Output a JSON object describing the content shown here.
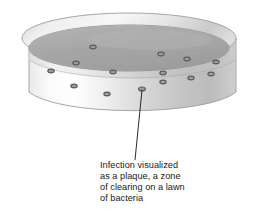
{
  "figure": {
    "caption_lines": [
      "Infection visualized",
      "as a plaque, a zone",
      "of clearing on a lawn",
      "of bacteria"
    ]
  },
  "colors": {
    "background": "#ffffff",
    "agar_surface_light": "#b6b6b6",
    "agar_surface": "#a9a9a9",
    "agar_surface_dark": "#9d9d9d",
    "rim_top_light": "#f2f2f2",
    "rim_top": "#d8d8d8",
    "rim_outline": "#8f8f8f",
    "wall_light": "#fdfdfd",
    "wall_mid": "#dcdcdc",
    "wall_dark": "#b9b9b9",
    "wall_outline": "#9a9a9a",
    "plaque_ring": "#5a5a5a",
    "plaque_fill": "#9a9a9a",
    "pointer_line": "#111111",
    "caption_text": "#1a1a1a"
  },
  "dish": {
    "rim_outer_center": [
      129,
      38
    ],
    "rim_outer_rx": 107,
    "rim_outer_ry": 25,
    "rim_inner_center": [
      129,
      48
    ],
    "rim_inner_rx": 100,
    "rim_inner_ry": 23,
    "wall_height": 70,
    "agar_line_offset": 22
  },
  "plaques": [
    {
      "cx": 93,
      "cy": 47,
      "rx": 3.2,
      "ry": 1.9
    },
    {
      "cx": 161,
      "cy": 54,
      "rx": 3.2,
      "ry": 1.9
    },
    {
      "cx": 187,
      "cy": 59,
      "rx": 3.2,
      "ry": 1.9
    },
    {
      "cx": 76,
      "cy": 63,
      "rx": 3.2,
      "ry": 1.9
    },
    {
      "cx": 216,
      "cy": 62,
      "rx": 3.2,
      "ry": 1.9
    },
    {
      "cx": 51,
      "cy": 71,
      "rx": 3.2,
      "ry": 1.9
    },
    {
      "cx": 113,
      "cy": 72,
      "rx": 3.2,
      "ry": 1.9
    },
    {
      "cx": 163,
      "cy": 73,
      "rx": 3.2,
      "ry": 1.9
    },
    {
      "cx": 211,
      "cy": 74,
      "rx": 3.2,
      "ry": 1.9
    },
    {
      "cx": 191,
      "cy": 78,
      "rx": 3.2,
      "ry": 1.9
    },
    {
      "cx": 74,
      "cy": 86,
      "rx": 3.2,
      "ry": 1.9
    },
    {
      "cx": 163,
      "cy": 82,
      "rx": 3.2,
      "ry": 1.9
    },
    {
      "cx": 107,
      "cy": 94,
      "rx": 3.2,
      "ry": 1.9
    },
    {
      "cx": 142,
      "cy": 89,
      "rx": 3.4,
      "ry": 2.0
    }
  ],
  "pointer": {
    "from": [
      142,
      90
    ],
    "to": [
      135,
      160
    ],
    "width": 0.9
  }
}
